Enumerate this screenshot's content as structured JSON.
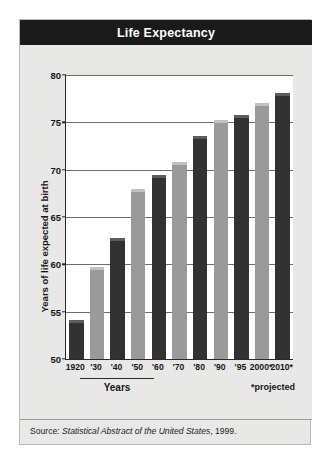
{
  "title": "Life Expectancy",
  "footer": {
    "source_prefix": "Source: ",
    "source_italic": "Statistical Abstract of the United States",
    "source_suffix": ", 1999."
  },
  "axis": {
    "y_title": "Years of life expected at birth",
    "x_title": "Years",
    "note": "*projected"
  },
  "chart_data": {
    "type": "bar",
    "title": "Life Expectancy",
    "xlabel": "Years",
    "ylabel": "Years of life expected at birth",
    "ylim": [
      50,
      80
    ],
    "yticks": [
      50,
      55,
      60,
      65,
      70,
      75,
      80
    ],
    "grid": true,
    "legend": null,
    "categories": [
      "1920",
      "'30",
      "'40",
      "'50",
      "'60",
      "'70",
      "'80",
      "'90",
      "'95",
      "2000*",
      "2010*"
    ],
    "values": [
      54.1,
      59.7,
      62.8,
      68.0,
      69.4,
      70.8,
      73.6,
      75.2,
      75.8,
      77.0,
      78.1
    ],
    "bar_colors": [
      "dark",
      "mid",
      "dark",
      "mid",
      "dark",
      "mid",
      "dark",
      "mid",
      "dark",
      "mid",
      "dark",
      "mid"
    ],
    "annotations": [
      "*projected"
    ]
  },
  "colors": {
    "title_bar": "#1a1a1a",
    "card_bg": "#e8e8e6",
    "plot_bg": "#ffffff",
    "bar_dark": "#323232",
    "bar_dark_cap": "#5c5c5c",
    "bar_mid": "#9a9a9a",
    "bar_mid_cap": "#c2c2c2",
    "axis": "#2a2a2a",
    "gridline": "#6e6e6e"
  }
}
